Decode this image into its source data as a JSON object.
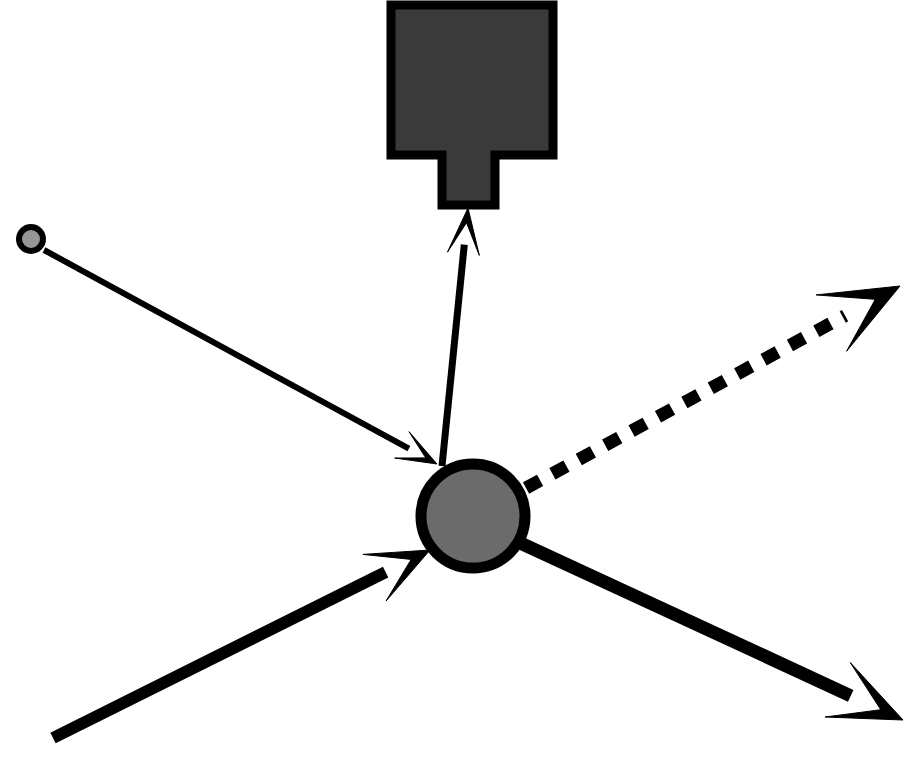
{
  "canvas": {
    "width": 916,
    "height": 760,
    "background": "#ffffff",
    "title": "Scattering interaction diagram"
  },
  "palette": {
    "stroke": "#000000",
    "detector_fill": "#3a3a3a",
    "target_fill": "#6b6b6b",
    "source_fill": "#969696",
    "background": "#ffffff"
  },
  "elements": {
    "detector": {
      "name": "detector-box",
      "shape": "rectangle-with-stem",
      "body": {
        "x": 391,
        "y": 5,
        "width": 162,
        "height": 150
      },
      "stem": {
        "x": 442,
        "y": 155,
        "width": 53,
        "height": 50
      },
      "fill": "#3a3a3a",
      "stroke": "#000000",
      "stroke_width": 9
    },
    "target_particle": {
      "name": "target-circle",
      "shape": "circle",
      "cx": 473,
      "cy": 516,
      "r": 52,
      "fill": "#6b6b6b",
      "stroke": "#000000",
      "stroke_width": 11
    },
    "source_particle": {
      "name": "source-circle",
      "shape": "circle",
      "cx": 31,
      "cy": 239,
      "r": 12,
      "fill": "#969696",
      "stroke": "#000000",
      "stroke_width": 6
    },
    "arrows": [
      {
        "name": "incident-thin-arrow",
        "style": "solid-thin",
        "from": [
          44,
          250
        ],
        "to": [
          437,
          464
        ],
        "stroke_width": 6,
        "head_length": 40,
        "head_half_width": 15,
        "head_notch": 0.32
      },
      {
        "name": "detector-arrow",
        "style": "solid-thin",
        "from": [
          442,
          466
        ],
        "to": [
          468,
          208
        ],
        "stroke_width": 7,
        "head_length": 46,
        "head_half_width": 16,
        "head_notch": 0.32
      },
      {
        "name": "incident-beam-arrow",
        "style": "solid-thick",
        "from": [
          53,
          738
        ],
        "to": [
          430,
          550
        ],
        "stroke_width": 12,
        "head_length": 62,
        "head_half_width": 26,
        "head_notch": 0.34
      },
      {
        "name": "scattered-beam-arrow",
        "style": "solid-thick",
        "from": [
          516,
          541
        ],
        "to": [
          903,
          720
        ],
        "stroke_width": 13,
        "head_length": 72,
        "head_half_width": 30,
        "head_notch": 0.34
      },
      {
        "name": "recoil-dashed-arrow",
        "style": "dashed-thick",
        "from": [
          526,
          488
        ],
        "to": [
          900,
          286
        ],
        "stroke_width": 13,
        "dash": "16 14",
        "head_length": 78,
        "head_half_width": 32,
        "head_notch": 0.36
      }
    ]
  }
}
